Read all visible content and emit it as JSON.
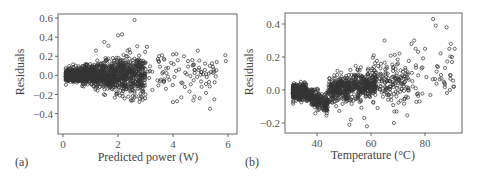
{
  "figure": {
    "panels": [
      "(a)",
      "(b)"
    ]
  },
  "chart_data": [
    {
      "type": "scatter",
      "panel_label": "(a)",
      "title": "",
      "xlabel": "Predicted power (W)",
      "ylabel": "Residuals",
      "xlim": [
        -0.3,
        6.2
      ],
      "ylim": [
        -0.42,
        0.65
      ],
      "xticks": [
        0,
        2,
        4,
        6
      ],
      "xtick_labels": [
        "0",
        "2",
        "4",
        "6"
      ],
      "yticks": [
        -0.4,
        -0.2,
        0.0,
        0.2,
        0.4,
        0.6
      ],
      "ytick_labels": [
        "−0.4",
        "−0.2",
        "0.0",
        "0.2",
        "0.4",
        "0.6"
      ],
      "grid": false,
      "legend": null,
      "marker": "open circle",
      "marker_color": "#333333",
      "description": "Dense cluster of residuals near 0 for predicted power 0.1-3 W (spread ~±0.15), fanning out (heteroscedastic) at higher predicted power.",
      "dense_region": {
        "x_range": [
          0.1,
          3.0
        ],
        "y_range": [
          -0.15,
          0.15
        ],
        "approx_count": 1200
      },
      "notable_points": [
        {
          "x": 2.6,
          "y": 0.58
        },
        {
          "x": 2.0,
          "y": 0.42
        },
        {
          "x": 2.15,
          "y": 0.43
        },
        {
          "x": 1.5,
          "y": 0.35
        },
        {
          "x": 1.65,
          "y": 0.31
        },
        {
          "x": 3.05,
          "y": 0.3
        },
        {
          "x": 2.35,
          "y": 0.26
        },
        {
          "x": 1.2,
          "y": 0.26
        },
        {
          "x": 4.9,
          "y": 0.26
        },
        {
          "x": 5.9,
          "y": 0.21
        },
        {
          "x": 5.92,
          "y": 0.15
        },
        {
          "x": 4.0,
          "y": 0.22
        },
        {
          "x": 3.6,
          "y": 0.21
        },
        {
          "x": 4.4,
          "y": 0.2
        },
        {
          "x": 4.7,
          "y": 0.16
        },
        {
          "x": 5.35,
          "y": -0.35
        },
        {
          "x": 5.5,
          "y": -0.25
        },
        {
          "x": 4.0,
          "y": -0.28
        },
        {
          "x": 4.15,
          "y": -0.27
        },
        {
          "x": 4.3,
          "y": -0.23
        },
        {
          "x": 2.55,
          "y": -0.26
        },
        {
          "x": 4.6,
          "y": -0.17
        },
        {
          "x": 5.2,
          "y": -0.09
        },
        {
          "x": 5.5,
          "y": 0.04
        },
        {
          "x": 5.3,
          "y": 0.02
        },
        {
          "x": 1.95,
          "y": -0.19
        },
        {
          "x": 3.0,
          "y": -0.2
        }
      ]
    },
    {
      "type": "scatter",
      "panel_label": "(b)",
      "title": "",
      "xlabel": "Temperature (°C)",
      "ylabel": "Residuals",
      "xlim": [
        28,
        93
      ],
      "ylim": [
        -0.26,
        0.46
      ],
      "xticks": [
        40,
        60,
        80
      ],
      "xtick_labels": [
        "40",
        "60",
        "80"
      ],
      "yticks": [
        -0.2,
        0.0,
        0.2,
        0.4
      ],
      "ytick_labels": [
        "−0.2",
        "0.0",
        "0.2",
        "0.4"
      ],
      "grid": false,
      "legend": null,
      "marker": "open circle",
      "marker_color": "#333333",
      "description": "Dense band at 31-36 °C near 0, a sloping dense band 36-44 °C trending to ~-0.1, a second dense cluster 44-62 °C near 0, and increasing positive residual spread above 65 °C.",
      "dense_regions": [
        {
          "x_range": [
            31,
            36
          ],
          "y_range": [
            -0.06,
            0.04
          ]
        },
        {
          "x_range": [
            36,
            44
          ],
          "y_range": [
            -0.12,
            0.02
          ]
        },
        {
          "x_range": [
            44,
            62
          ],
          "y_range": [
            -0.1,
            0.08
          ]
        }
      ],
      "notable_points": [
        {
          "x": 83,
          "y": 0.43
        },
        {
          "x": 84,
          "y": 0.39
        },
        {
          "x": 88,
          "y": 0.38
        },
        {
          "x": 65,
          "y": 0.3
        },
        {
          "x": 76,
          "y": 0.3
        },
        {
          "x": 75,
          "y": 0.28
        },
        {
          "x": 76.5,
          "y": 0.25
        },
        {
          "x": 80,
          "y": 0.25
        },
        {
          "x": 89,
          "y": 0.25
        },
        {
          "x": 91,
          "y": 0.25
        },
        {
          "x": 61,
          "y": 0.21
        },
        {
          "x": 90,
          "y": 0.2
        },
        {
          "x": 90,
          "y": 0.17
        },
        {
          "x": 70,
          "y": 0.16
        },
        {
          "x": 58.5,
          "y": -0.22
        },
        {
          "x": 52,
          "y": -0.21
        },
        {
          "x": 68.5,
          "y": -0.2
        },
        {
          "x": 52.5,
          "y": -0.18
        },
        {
          "x": 57.5,
          "y": -0.17
        },
        {
          "x": 69.5,
          "y": -0.13
        },
        {
          "x": 78,
          "y": -0.07
        },
        {
          "x": 82,
          "y": -0.03
        },
        {
          "x": 87,
          "y": 0.05
        },
        {
          "x": 89.5,
          "y": 0.09
        }
      ]
    }
  ]
}
